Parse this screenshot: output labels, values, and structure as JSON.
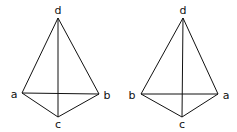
{
  "figures": [
    {
      "name": "tetrahedron-left",
      "vertices": {
        "d": {
          "label": "d",
          "x": 58,
          "y": 18
        },
        "a": {
          "label": "a",
          "x": 22,
          "y": 93
        },
        "b": {
          "label": "b",
          "x": 99,
          "y": 94
        },
        "c": {
          "label": "c",
          "x": 58,
          "y": 117
        }
      },
      "labels": {
        "d": {
          "text": "d",
          "x": 58,
          "y": 14
        },
        "a": {
          "text": "a",
          "x": 14,
          "y": 98
        },
        "b": {
          "text": "b",
          "x": 107,
          "y": 99
        },
        "c": {
          "text": "c",
          "x": 58,
          "y": 128
        }
      }
    },
    {
      "name": "tetrahedron-right",
      "vertices": {
        "d": {
          "label": "d",
          "x": 183,
          "y": 18
        },
        "b": {
          "label": "b",
          "x": 141,
          "y": 94
        },
        "a": {
          "label": "a",
          "x": 218,
          "y": 94
        },
        "c": {
          "label": "c",
          "x": 182,
          "y": 117
        }
      },
      "labels": {
        "d": {
          "text": "d",
          "x": 183,
          "y": 14
        },
        "b": {
          "text": "b",
          "x": 132,
          "y": 99
        },
        "a": {
          "text": "a",
          "x": 226,
          "y": 99
        },
        "c": {
          "text": "c",
          "x": 182,
          "y": 128
        }
      }
    }
  ],
  "edges": [
    "da",
    "db",
    "dc",
    "ab",
    "ac",
    "bc"
  ],
  "colors": {
    "stroke": "#111111",
    "background": "#ffffff"
  }
}
